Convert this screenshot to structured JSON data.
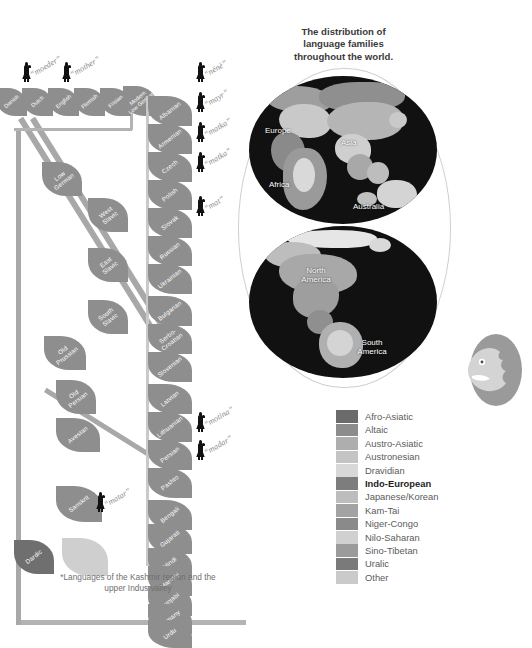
{
  "map": {
    "title": "The distribution of\nlanguage families\nthroughout the world.",
    "title_line1": "The distribution of",
    "title_line2": "language families",
    "title_line3": "throughout the world.",
    "labels": {
      "europe": "Europe",
      "asia": "Asia",
      "africa": "Africa",
      "australia": "Australia",
      "north_america": "North\nAmerica",
      "north_america_l1": "North",
      "north_america_l2": "America",
      "south_america_l1": "South",
      "south_america_l2": "America"
    }
  },
  "legend": {
    "items": [
      {
        "label": "Afro-Asiatic",
        "color": "#6b6b6b",
        "highlight": false
      },
      {
        "label": "Altaic",
        "color": "#8c8c8c",
        "highlight": false
      },
      {
        "label": "Austro-Asiatic",
        "color": "#aeaeae",
        "highlight": false
      },
      {
        "label": "Austronesian",
        "color": "#c4c4c4",
        "highlight": false
      },
      {
        "label": "Dravidian",
        "color": "#d8d8d8",
        "highlight": false
      },
      {
        "label": "Indo-European",
        "color": "#7d7d7d",
        "highlight": true
      },
      {
        "label": "Japanese/Korean",
        "color": "#bdbdbd",
        "highlight": false
      },
      {
        "label": "Kam-Tai",
        "color": "#a3a3a3",
        "highlight": false
      },
      {
        "label": "Niger-Congo",
        "color": "#8a8a8a",
        "highlight": false
      },
      {
        "label": "Nilo-Saharan",
        "color": "#d0d0d0",
        "highlight": false
      },
      {
        "label": "Sino-Tibetan",
        "color": "#9b9b9b",
        "highlight": false
      },
      {
        "label": "Uralic",
        "color": "#7a7a7a",
        "highlight": false
      },
      {
        "label": "Other",
        "color": "#cacaca",
        "highlight": false
      }
    ]
  },
  "footnote": "*Languages of the Kashmir region and the upper Indus valley",
  "tree": {
    "branch_nodes": [
      {
        "id": "low-german",
        "label_l1": "Low",
        "label_l2": "German"
      },
      {
        "id": "west-slavic",
        "label_l1": "West",
        "label_l2": "Slavic"
      },
      {
        "id": "east-slavic",
        "label_l1": "East",
        "label_l2": "Slavic"
      },
      {
        "id": "south-slavic",
        "label_l1": "South",
        "label_l2": "Slavic"
      },
      {
        "id": "old-prussian",
        "label_l1": "Old",
        "label_l2": "Prussian"
      },
      {
        "id": "old-persian",
        "label_l1": "Old",
        "label_l2": "Persian"
      },
      {
        "id": "avestan",
        "label_l1": "Avestan",
        "label_l2": ""
      },
      {
        "id": "sanskrit",
        "label_l1": "Sanskrit",
        "label_l2": ""
      },
      {
        "id": "dardic",
        "label_l1": "Dardic",
        "label_l2": ""
      },
      {
        "id": "unlabeled",
        "label_l1": "",
        "label_l2": ""
      }
    ],
    "germanic_tips": [
      {
        "label_l1": "Danish",
        "label_l2": ""
      },
      {
        "label_l1": "Dutch",
        "label_l2": ""
      },
      {
        "label_l1": "English",
        "label_l2": ""
      },
      {
        "label_l1": "Flemish",
        "label_l2": ""
      },
      {
        "label_l1": "Frisian",
        "label_l2": ""
      },
      {
        "label_l1": "Modern",
        "label_l2": "Low German"
      }
    ],
    "right_tips": [
      {
        "label_l1": "Albanian",
        "label_l2": ""
      },
      {
        "label_l1": "Armenian",
        "label_l2": ""
      },
      {
        "label_l1": "Czech",
        "label_l2": ""
      },
      {
        "label_l1": "Polish",
        "label_l2": ""
      },
      {
        "label_l1": "Slovak",
        "label_l2": ""
      },
      {
        "label_l1": "Russian",
        "label_l2": ""
      },
      {
        "label_l1": "Ukrainian",
        "label_l2": ""
      },
      {
        "label_l1": "Bulgarian",
        "label_l2": ""
      },
      {
        "label_l1": "Serbo-",
        "label_l2": "Croatian"
      },
      {
        "label_l1": "Slovenian",
        "label_l2": ""
      },
      {
        "label_l1": "Latvian",
        "label_l2": ""
      },
      {
        "label_l1": "Lithuanian",
        "label_l2": ""
      },
      {
        "label_l1": "Persian",
        "label_l2": ""
      },
      {
        "label_l1": "Pashto",
        "label_l2": ""
      },
      {
        "label_l1": "Bengali",
        "label_l2": ""
      },
      {
        "label_l1": "Gujarati",
        "label_l2": ""
      },
      {
        "label_l1": "Hindi",
        "label_l2": ""
      },
      {
        "label_l1": "Marathi",
        "label_l2": ""
      },
      {
        "label_l1": "Punjabi",
        "label_l2": ""
      },
      {
        "label_l1": "Romany",
        "label_l2": ""
      },
      {
        "label_l1": "Urdu",
        "label_l2": ""
      }
    ],
    "words": [
      {
        "id": "moeder",
        "text": "“moeder”"
      },
      {
        "id": "mother",
        "text": "“mother”"
      },
      {
        "id": "nene",
        "text": "“nënë”"
      },
      {
        "id": "mayr",
        "text": "“mayr”"
      },
      {
        "id": "matka1",
        "text": "“matka”"
      },
      {
        "id": "matka2",
        "text": "“matka”"
      },
      {
        "id": "mat",
        "text": "“mat”"
      },
      {
        "id": "motina",
        "text": "“motina”"
      },
      {
        "id": "madar",
        "text": "“madar”"
      },
      {
        "id": "matar",
        "text": "“matar”"
      }
    ]
  }
}
